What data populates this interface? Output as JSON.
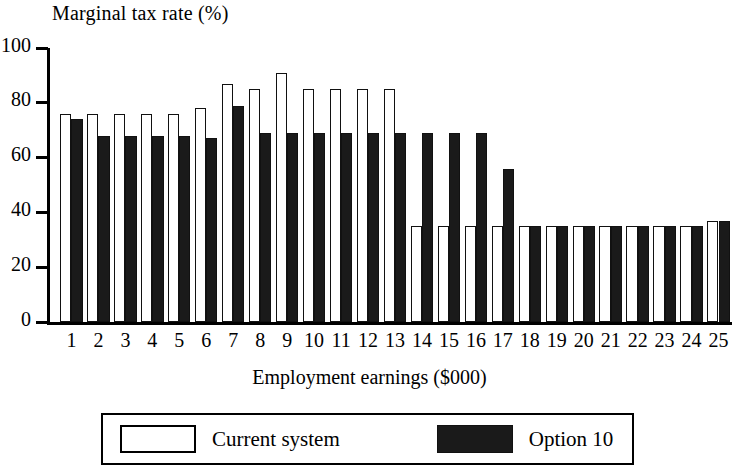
{
  "chart_data": {
    "type": "bar",
    "title": "",
    "ylabel": "Marginal tax rate (%)",
    "xlabel": "Employment earnings ($000)",
    "ylim": [
      0,
      100
    ],
    "yticks": [
      0,
      20,
      40,
      60,
      80,
      100
    ],
    "grid": false,
    "legend_position": "bottom",
    "categories": [
      "1",
      "2",
      "3",
      "4",
      "5",
      "6",
      "7",
      "8",
      "9",
      "10",
      "11",
      "12",
      "13",
      "14",
      "15",
      "16",
      "17",
      "18",
      "19",
      "20",
      "21",
      "22",
      "23",
      "24",
      "25"
    ],
    "series": [
      {
        "name": "Current system",
        "style": "white-outline",
        "color": "#ffffff",
        "values": [
          76,
          76,
          76,
          76,
          76,
          78,
          87,
          85,
          91,
          85,
          85,
          85,
          85,
          35,
          35,
          35,
          35,
          35,
          35,
          35,
          35,
          35,
          35,
          35,
          37
        ]
      },
      {
        "name": "Option 10",
        "style": "solid-black",
        "color": "#1a1a1a",
        "values": [
          74,
          68,
          68,
          68,
          68,
          67,
          79,
          69,
          69,
          69,
          69,
          69,
          69,
          69,
          69,
          69,
          56,
          35,
          35,
          35,
          35,
          35,
          35,
          35,
          37
        ]
      }
    ]
  },
  "legend": {
    "items": [
      {
        "label": "Current system",
        "swatch": "white-outline-swatch"
      },
      {
        "label": "Option 10",
        "swatch": "black-filled-swatch"
      }
    ]
  },
  "axes": {
    "y_title": "Marginal tax rate (%)",
    "x_title": "Employment earnings ($000)",
    "y_tick_labels": [
      "100",
      "80",
      "60",
      "40",
      "20",
      "0"
    ],
    "x_tick_labels": [
      "1",
      "2",
      "3",
      "4",
      "5",
      "6",
      "7",
      "8",
      "9",
      "10",
      "11",
      "12",
      "13",
      "14",
      "15",
      "16",
      "17",
      "18",
      "19",
      "20",
      "21",
      "22",
      "23",
      "24",
      "25"
    ]
  }
}
